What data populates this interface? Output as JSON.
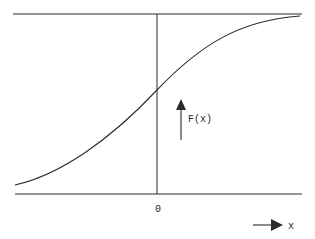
{
  "diagram": {
    "colors": {
      "stroke": "#2a2a2a",
      "background": "#ffffff"
    },
    "labels": {
      "y_axis": "F(x)",
      "origin": "0",
      "x_axis": "x"
    },
    "elements": {
      "upper_asymptote": {
        "x1": 13,
        "y1": 14,
        "x2": 302,
        "y2": 14
      },
      "lower_asymptote": {
        "x1": 15,
        "y1": 194,
        "x2": 302,
        "y2": 194
      },
      "vertical_axis": {
        "x1": 157,
        "y1": 14,
        "x2": 157,
        "y2": 194
      },
      "y_arrow": {
        "x": 181,
        "y_start": 140,
        "y_end": 100
      },
      "x_arrow": {
        "y": 225,
        "x_start": 253,
        "x_end": 282
      }
    },
    "curve": {
      "type": "sigmoid",
      "start": [
        15,
        185
      ],
      "inflection": [
        157,
        90
      ],
      "end": [
        300,
        16
      ]
    }
  }
}
